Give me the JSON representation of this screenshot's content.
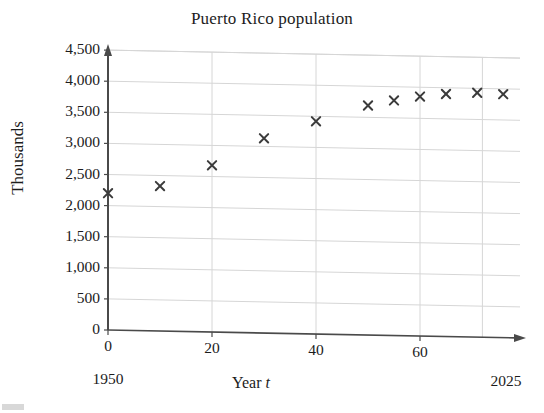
{
  "chart_data": {
    "type": "scatter",
    "title": "Puerto Rico population",
    "xlabel": "Year t",
    "xlabel_plain": "Year",
    "xlabel_variable": "t",
    "ylabel": "Thousands",
    "xlim": [
      0,
      78
    ],
    "ylim": [
      0,
      4500
    ],
    "grid": true,
    "legend": null,
    "marker": "x",
    "marker_color": "#3b3b3b",
    "axis_color": "#4a4a4a",
    "grid_color": "#d6d6d6",
    "x_axis_start_annotation": "1950",
    "x_axis_end_annotation": "2025",
    "xticks": [
      0,
      20,
      40,
      60
    ],
    "xtick_labels": [
      "0",
      "20",
      "40",
      "60"
    ],
    "yticks": [
      0,
      500,
      1000,
      1500,
      2000,
      2500,
      3000,
      3500,
      4000,
      4500
    ],
    "ytick_labels": [
      "0",
      "500",
      "1,000",
      "1,500",
      "2,000",
      "2,500",
      "3,000",
      "3,500",
      "4,000",
      "4,500"
    ],
    "x": [
      0,
      10,
      20,
      30,
      40,
      50,
      55,
      60,
      65,
      71,
      76
    ],
    "values": [
      2200,
      2330,
      2680,
      3130,
      3420,
      3690,
      3780,
      3850,
      3900,
      3930,
      3915
    ],
    "points": [
      {
        "x": 0,
        "y": 2200
      },
      {
        "x": 10,
        "y": 2330
      },
      {
        "x": 20,
        "y": 2680
      },
      {
        "x": 30,
        "y": 3130
      },
      {
        "x": 40,
        "y": 3420
      },
      {
        "x": 50,
        "y": 3690
      },
      {
        "x": 55,
        "y": 3780
      },
      {
        "x": 60,
        "y": 3850
      },
      {
        "x": 65,
        "y": 3900
      },
      {
        "x": 71,
        "y": 3930
      },
      {
        "x": 76,
        "y": 3915
      }
    ]
  }
}
